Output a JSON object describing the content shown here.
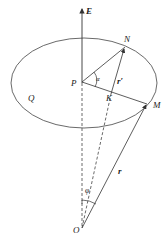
{
  "diagram": {
    "type": "geometry-cone-vectors",
    "labels": {
      "axis": "E",
      "plane": "Q",
      "center": "P",
      "point_n": "N",
      "point_m": "M",
      "point_k": "K",
      "origin": "O",
      "angle_alpha": "α",
      "angle_phi": "φ",
      "vector_r": "r",
      "vector_r_prime": "r′"
    },
    "colors": {
      "stroke": "#333333",
      "background": "#ffffff"
    }
  }
}
